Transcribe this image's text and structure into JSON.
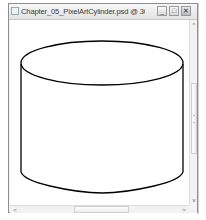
{
  "window": {
    "title": "Chapter_05_PixelArtCylinder.psd @ 300% (CYLIN...",
    "controls": {
      "minimize_icon": "minimize-icon",
      "maximize_icon": "maximize-icon",
      "close_icon": "close-icon",
      "minimize_glyph": "_",
      "maximize_glyph": "□",
      "close_glyph": "✕"
    }
  },
  "canvas": {
    "drawing": "cylinder-outline",
    "stroke_color": "#000000",
    "background_color": "#ffffff"
  },
  "scrollbars": {
    "vertical": {
      "up_glyph": "^",
      "down_glyph": "v"
    },
    "horizontal": {
      "left_glyph": "<",
      "right_glyph": ">"
    }
  }
}
